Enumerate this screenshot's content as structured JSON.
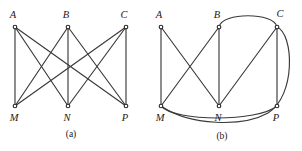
{
  "figure": {
    "background_color": "#ffffff",
    "edge_color": "#3a3a3a",
    "vertex_fill": "#ffffff",
    "vertex_stroke": "#2b2b2b",
    "label_color": "#1a1a1a",
    "width": 302,
    "height": 151
  },
  "panels": [
    {
      "id": "panel-a",
      "caption": "(a)",
      "caption_pos": {
        "x": 71,
        "y": 137
      },
      "description": "Complete bipartite graph K(3,3) drawn with straight edges and crossings",
      "vertices": [
        {
          "id": "A",
          "label": "A",
          "x": 15,
          "y": 27,
          "label_x": 13,
          "label_y": 18
        },
        {
          "id": "B",
          "label": "B",
          "x": 68,
          "y": 27,
          "label_x": 66,
          "label_y": 18
        },
        {
          "id": "C",
          "label": "C",
          "x": 126,
          "y": 27,
          "label_x": 124,
          "label_y": 18
        },
        {
          "id": "M",
          "label": "M",
          "x": 15,
          "y": 106,
          "label_x": 14,
          "label_y": 121
        },
        {
          "id": "N",
          "label": "N",
          "x": 68,
          "y": 106,
          "label_x": 67,
          "label_y": 121
        },
        {
          "id": "P",
          "label": "P",
          "x": 126,
          "y": 106,
          "label_x": 125,
          "label_y": 121
        }
      ],
      "edges": [
        {
          "id": "a-A-M",
          "from": "A",
          "to": "M",
          "type": "line",
          "d": "M 15 27 L 15 106"
        },
        {
          "id": "a-A-N",
          "from": "A",
          "to": "N",
          "type": "line",
          "d": "M 15 27 L 68 106"
        },
        {
          "id": "a-A-P",
          "from": "A",
          "to": "P",
          "type": "line",
          "d": "M 15 27 L 126 106"
        },
        {
          "id": "a-B-M",
          "from": "B",
          "to": "M",
          "type": "line",
          "d": "M 68 27 L 15 106"
        },
        {
          "id": "a-B-N",
          "from": "B",
          "to": "N",
          "type": "line",
          "d": "M 68 27 L 68 106"
        },
        {
          "id": "a-B-P",
          "from": "B",
          "to": "P",
          "type": "line",
          "d": "M 68 27 L 126 106"
        },
        {
          "id": "a-C-M",
          "from": "C",
          "to": "M",
          "type": "line",
          "d": "M 126 27 L 15 106"
        },
        {
          "id": "a-C-N",
          "from": "C",
          "to": "N",
          "type": "line",
          "d": "M 126 27 L 68 106"
        },
        {
          "id": "a-C-P",
          "from": "C",
          "to": "P",
          "type": "line",
          "d": "M 126 27 L 126 106"
        }
      ]
    },
    {
      "id": "panel-b",
      "caption": "(b)",
      "caption_pos": {
        "x": 222,
        "y": 139
      },
      "description": "Same graph redrawn with curved edges to reduce crossings",
      "vertices": [
        {
          "id": "A",
          "label": "A",
          "x": 161,
          "y": 27,
          "label_x": 159,
          "label_y": 18
        },
        {
          "id": "B",
          "label": "B",
          "x": 219,
          "y": 27,
          "label_x": 217,
          "label_y": 18
        },
        {
          "id": "C",
          "label": "C",
          "x": 277,
          "y": 27,
          "label_x": 279,
          "label_y": 17
        },
        {
          "id": "M",
          "label": "M",
          "x": 161,
          "y": 106,
          "label_x": 160,
          "label_y": 121
        },
        {
          "id": "N",
          "label": "N",
          "x": 219,
          "y": 106,
          "label_x": 218,
          "label_y": 121
        },
        {
          "id": "P",
          "label": "P",
          "x": 277,
          "y": 106,
          "label_x": 276,
          "label_y": 121
        }
      ],
      "edges": [
        {
          "id": "b-A-M",
          "from": "A",
          "to": "M",
          "type": "line",
          "d": "M 161 27 L 161 106"
        },
        {
          "id": "b-A-N",
          "from": "A",
          "to": "N",
          "type": "line",
          "d": "M 161 27 L 219 106"
        },
        {
          "id": "b-B-M",
          "from": "B",
          "to": "M",
          "type": "line",
          "d": "M 219 27 L 161 106"
        },
        {
          "id": "b-B-N",
          "from": "B",
          "to": "N",
          "type": "line",
          "d": "M 219 27 L 219 106"
        },
        {
          "id": "b-B-C",
          "from": "B",
          "to": "C",
          "type": "curve",
          "d": "M 219 27 C 222 12 274 12 277 27"
        },
        {
          "id": "b-C-N",
          "from": "C",
          "to": "N",
          "type": "line",
          "d": "M 277 27 L 219 106"
        },
        {
          "id": "b-C-P",
          "from": "C",
          "to": "P",
          "type": "line",
          "d": "M 277 27 L 277 106"
        },
        {
          "id": "b-C-M",
          "from": "C",
          "to": "M",
          "type": "curve",
          "d": "M 277 27 C 294 34 296 96 268 113 C 243 127 190 126 161 106"
        },
        {
          "id": "b-M-P",
          "from": "M",
          "to": "P",
          "type": "curve",
          "d": "M 161 106 C 175 122 258 122 277 106"
        }
      ]
    }
  ]
}
